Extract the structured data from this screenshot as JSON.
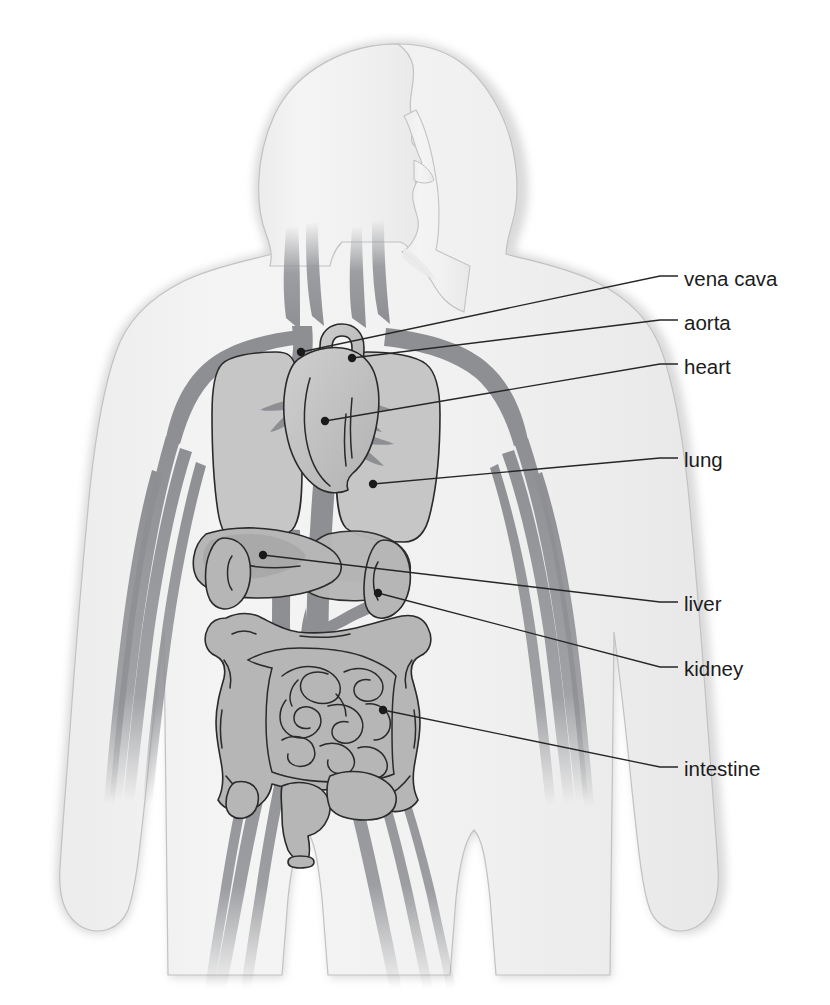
{
  "diagram": {
    "view": "anterior",
    "background_color": "#ffffff",
    "palette": {
      "body_fill": "#f2f2f2",
      "body_edge": "#b9b9b9",
      "organ_fill": "#b9b9b9",
      "organ_fill_light": "#c8c8c8",
      "organ_outline": "#2a2a2a",
      "vessel": "#8d8f93",
      "label_text": "#1c1c1c",
      "leader_line": "#262626"
    },
    "labels": [
      {
        "id": "vena-cava",
        "label": "vena cava",
        "text_x": 684,
        "text_y": 286,
        "dot_x": 301,
        "dot_y": 352,
        "elbow_x": 668,
        "elbow_y": 279
      },
      {
        "id": "aorta",
        "label": "aorta",
        "text_x": 684,
        "text_y": 330,
        "dot_x": 352,
        "dot_y": 358,
        "elbow_x": 668,
        "elbow_y": 323
      },
      {
        "id": "heart",
        "label": "heart",
        "text_x": 684,
        "text_y": 374,
        "dot_x": 325,
        "dot_y": 421,
        "elbow_x": 668,
        "elbow_y": 367
      },
      {
        "id": "lung",
        "label": "lung",
        "text_x": 684,
        "text_y": 467,
        "dot_x": 373,
        "dot_y": 484,
        "elbow_x": 668,
        "elbow_y": 461
      },
      {
        "id": "liver",
        "label": "liver",
        "text_x": 684,
        "text_y": 611,
        "dot_x": 263,
        "dot_y": 555,
        "elbow_x": 668,
        "elbow_y": 604
      },
      {
        "id": "kidney",
        "label": "kidney",
        "text_x": 684,
        "text_y": 676,
        "dot_x": 378,
        "dot_y": 593,
        "elbow_x": 668,
        "elbow_y": 669
      },
      {
        "id": "intestine",
        "label": "intestine",
        "text_x": 684,
        "text_y": 776,
        "dot_x": 383,
        "dot_y": 710,
        "elbow_x": 668,
        "elbow_y": 769
      }
    ],
    "organs": [
      {
        "id": "heart",
        "name": "heart"
      },
      {
        "id": "lung-left",
        "name": "lung"
      },
      {
        "id": "lung-right",
        "name": "lung"
      },
      {
        "id": "liver",
        "name": "liver"
      },
      {
        "id": "kidney-left",
        "name": "kidney"
      },
      {
        "id": "kidney-right",
        "name": "kidney"
      },
      {
        "id": "large-intestine",
        "name": "intestine"
      },
      {
        "id": "small-intestine",
        "name": "intestine"
      },
      {
        "id": "stomach",
        "name": "stomach"
      },
      {
        "id": "bladder",
        "name": "bladder"
      },
      {
        "id": "aorta",
        "name": "aorta"
      },
      {
        "id": "vena-cava",
        "name": "vena cava"
      }
    ]
  }
}
